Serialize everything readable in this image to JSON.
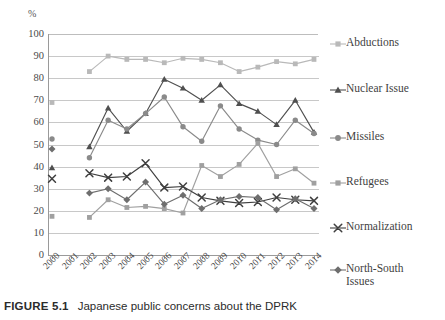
{
  "figure": {
    "caption_label": "FIGURE 5.1",
    "caption_text": "Japanese public concerns about the DPRK"
  },
  "axis": {
    "y_unit": "%",
    "y_ticks": [
      "100",
      "90",
      "80",
      "70",
      "60",
      "50",
      "40",
      "30",
      "20",
      "10",
      "0"
    ]
  },
  "legend": {
    "items": [
      {
        "label": "Abductions",
        "marker": "square",
        "color": "#b9b9b9"
      },
      {
        "label": "Nuclear Issue",
        "marker": "triangle",
        "color": "#4f4f4f"
      },
      {
        "label": "Missiles",
        "marker": "circle",
        "color": "#8a8a8a"
      },
      {
        "label": "Refugees",
        "marker": "square",
        "color": "#a0a0a0"
      },
      {
        "label": "Normalization",
        "marker": "cross",
        "color": "#3f3f3f"
      },
      {
        "label": "North-South\nIssues",
        "marker": "diamond",
        "color": "#6e6e6e"
      }
    ]
  },
  "chart_data": {
    "type": "line",
    "title": "Japanese public concerns about the DPRK",
    "xlabel": "",
    "ylabel": "%",
    "ylim": [
      0,
      100
    ],
    "ytick_step": 10,
    "grid": true,
    "legend_position": "right",
    "categories": [
      "2000",
      "2001",
      "2002",
      "2003",
      "2004",
      "2005",
      "2006",
      "2007",
      "2008",
      "2009",
      "2010",
      "2011",
      "2012",
      "2013",
      "2014"
    ],
    "series": [
      {
        "name": "Abductions",
        "color": "#b9b9b9",
        "marker": "square",
        "values": [
          69,
          null,
          83,
          90,
          88.5,
          88.5,
          87,
          89,
          88.5,
          87,
          83,
          85,
          87.5,
          86.5,
          88.5
        ]
      },
      {
        "name": "Nuclear Issue",
        "color": "#4f4f4f",
        "marker": "triangle",
        "values": [
          39.5,
          null,
          49,
          66.5,
          56,
          64,
          79.5,
          75.5,
          70,
          77,
          68.5,
          65,
          59,
          70,
          55.5
        ]
      },
      {
        "name": "Missiles",
        "color": "#8a8a8a",
        "marker": "circle",
        "values": [
          52.5,
          null,
          44,
          61,
          57,
          64,
          71.5,
          58,
          51.5,
          67.5,
          57,
          52,
          50,
          61,
          55
        ]
      },
      {
        "name": "Refugees",
        "color": "#a0a0a0",
        "marker": "square",
        "values": [
          17.5,
          null,
          17,
          25,
          21.5,
          22,
          21,
          19,
          40.5,
          35.5,
          41,
          50.5,
          35.5,
          39,
          32.5
        ]
      },
      {
        "name": "Normalization",
        "color": "#3f3f3f",
        "marker": "cross",
        "values": [
          34.5,
          null,
          37,
          35,
          35.5,
          41.5,
          30.5,
          31,
          26,
          24.5,
          23.5,
          24,
          26,
          25,
          24.5
        ]
      },
      {
        "name": "North-South Issues",
        "color": "#6e6e6e",
        "marker": "diamond",
        "values": [
          48,
          null,
          28,
          30,
          25,
          33,
          23,
          27,
          21,
          25,
          26.5,
          26,
          20.5,
          25.5,
          21
        ]
      }
    ]
  }
}
